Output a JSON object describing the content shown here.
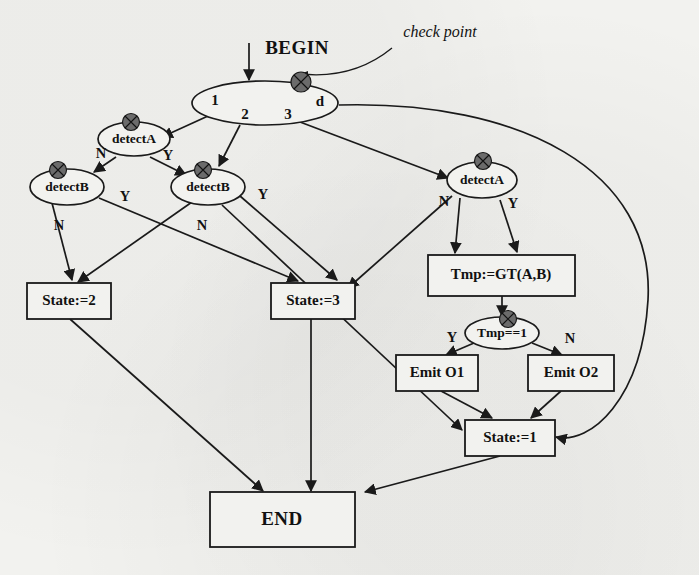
{
  "diagram": {
    "title": "BEGIN",
    "annotation": "check point",
    "end_label": "END",
    "colors": {
      "background": "#f2f2ef",
      "ink": "#1a1a1a",
      "checkpoint_fill": "#6b6b6b"
    },
    "nodes": {
      "begin": "BEGIN",
      "dispatch_branches": [
        "1",
        "2",
        "3",
        "d"
      ],
      "detect_a_left": "detectA",
      "detect_b_left": "detectB",
      "detect_b_mid": "detectB",
      "detect_a_right": "detectA",
      "tmp_assign": "Tmp:=GT(A,B)",
      "tmp_test": "Tmp==1",
      "emit_o1": "Emit O1",
      "emit_o2": "Emit O2",
      "state_1": "State:=1",
      "state_2": "State:=2",
      "state_3": "State:=3",
      "end": "END"
    },
    "edge_labels": {
      "detect_a_left_no": "N",
      "detect_a_left_yes": "Y",
      "detect_b_left_no": "N",
      "detect_b_left_yes": "Y",
      "detect_b_mid_no": "N",
      "detect_b_mid_yes": "Y",
      "detect_a_right_no": "N",
      "detect_a_right_yes": "Y",
      "tmp_test_yes": "Y",
      "tmp_test_no": "N"
    },
    "selector_labels": {
      "b1": "1",
      "b2": "2",
      "b3": "3",
      "bd": "d"
    }
  }
}
